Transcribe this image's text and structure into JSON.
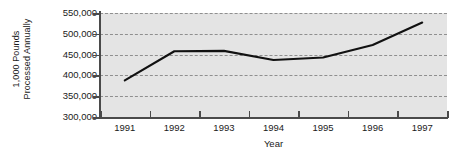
{
  "chart_data": {
    "type": "line",
    "title": "",
    "xlabel": "Year",
    "ylabel": "1,000 Pounds Processed Annually",
    "ylabel_lines": [
      "1,000 Pounds",
      "Processed Annually"
    ],
    "categories": [
      "1991",
      "1992",
      "1993",
      "1994",
      "1995",
      "1996",
      "1997"
    ],
    "x": [
      1991,
      1992,
      1993,
      1994,
      1995,
      1996,
      1997
    ],
    "values": [
      388000,
      458000,
      459000,
      437000,
      443000,
      473000,
      527000
    ],
    "series": [
      {
        "name": "1,000 Pounds Processed Annually",
        "values": [
          388000,
          458000,
          459000,
          437000,
          443000,
          473000,
          527000
        ]
      }
    ],
    "ylim": [
      300000,
      550000
    ],
    "yticks": [
      300000,
      350000,
      400000,
      450000,
      500000,
      550000
    ],
    "ytick_labels": [
      "300,000",
      "350,000",
      "400,000",
      "450,000",
      "500,000",
      "550,000"
    ],
    "xtick_labels": [
      "1991",
      "1992",
      "1993",
      "1994",
      "1995",
      "1996",
      "1997"
    ],
    "grid": true,
    "grid_style": "dashed-horizontal",
    "legend": false,
    "legend_position": "none",
    "colors": {
      "plot_background": "#e4e4e4",
      "gridline": "#8f8f8f",
      "axis": "#4a4a4a",
      "data_line": "#111111",
      "text": "#1a1a1a",
      "page_background": "#ffffff"
    }
  }
}
